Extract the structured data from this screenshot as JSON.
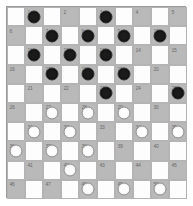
{
  "board": {
    "title": "International Draughts Board",
    "variant": "10x10",
    "rows": 10,
    "columns": 10,
    "colors": {
      "light_square": "#fdfdfd",
      "dark_square": "#b9b9b9",
      "black_piece": "#1b1b1b",
      "white_piece": "#fefefe",
      "grid_line": "#b4b4b4",
      "number_text": "#6a6a6a",
      "background": "#ffffff"
    },
    "legend": {
      "black_label": "black",
      "white_label": "white",
      "empty_label": "empty"
    },
    "squares": [
      [
        {
          "shade": "light",
          "number": "",
          "piece": ""
        },
        {
          "shade": "dark",
          "number": "1",
          "piece": "black"
        },
        {
          "shade": "light",
          "number": "",
          "piece": ""
        },
        {
          "shade": "dark",
          "number": "2",
          "piece": ""
        },
        {
          "shade": "light",
          "number": "",
          "piece": ""
        },
        {
          "shade": "dark",
          "number": "3",
          "piece": "black"
        },
        {
          "shade": "light",
          "number": "",
          "piece": ""
        },
        {
          "shade": "dark",
          "number": "4",
          "piece": ""
        },
        {
          "shade": "light",
          "number": "",
          "piece": ""
        },
        {
          "shade": "dark",
          "number": "5",
          "piece": ""
        }
      ],
      [
        {
          "shade": "dark",
          "number": "6",
          "piece": ""
        },
        {
          "shade": "light",
          "number": "",
          "piece": ""
        },
        {
          "shade": "dark",
          "number": "7",
          "piece": "black"
        },
        {
          "shade": "light",
          "number": "",
          "piece": ""
        },
        {
          "shade": "dark",
          "number": "8",
          "piece": "black"
        },
        {
          "shade": "light",
          "number": "",
          "piece": ""
        },
        {
          "shade": "dark",
          "number": "9",
          "piece": "black"
        },
        {
          "shade": "light",
          "number": "",
          "piece": ""
        },
        {
          "shade": "dark",
          "number": "10",
          "piece": "black"
        },
        {
          "shade": "light",
          "number": "",
          "piece": ""
        }
      ],
      [
        {
          "shade": "light",
          "number": "",
          "piece": ""
        },
        {
          "shade": "dark",
          "number": "11",
          "piece": "black"
        },
        {
          "shade": "light",
          "number": "",
          "piece": ""
        },
        {
          "shade": "dark",
          "number": "12",
          "piece": "black"
        },
        {
          "shade": "light",
          "number": "",
          "piece": ""
        },
        {
          "shade": "dark",
          "number": "13",
          "piece": "black"
        },
        {
          "shade": "light",
          "number": "",
          "piece": ""
        },
        {
          "shade": "dark",
          "number": "14",
          "piece": ""
        },
        {
          "shade": "light",
          "number": "",
          "piece": ""
        },
        {
          "shade": "dark",
          "number": "15",
          "piece": ""
        }
      ],
      [
        {
          "shade": "dark",
          "number": "16",
          "piece": ""
        },
        {
          "shade": "light",
          "number": "",
          "piece": ""
        },
        {
          "shade": "dark",
          "number": "17",
          "piece": "black"
        },
        {
          "shade": "light",
          "number": "",
          "piece": ""
        },
        {
          "shade": "dark",
          "number": "18",
          "piece": "black"
        },
        {
          "shade": "light",
          "number": "",
          "piece": ""
        },
        {
          "shade": "dark",
          "number": "19",
          "piece": "black"
        },
        {
          "shade": "light",
          "number": "",
          "piece": ""
        },
        {
          "shade": "dark",
          "number": "20",
          "piece": ""
        },
        {
          "shade": "light",
          "number": "",
          "piece": ""
        }
      ],
      [
        {
          "shade": "light",
          "number": "",
          "piece": ""
        },
        {
          "shade": "dark",
          "number": "21",
          "piece": ""
        },
        {
          "shade": "light",
          "number": "",
          "piece": ""
        },
        {
          "shade": "dark",
          "number": "22",
          "piece": ""
        },
        {
          "shade": "light",
          "number": "",
          "piece": ""
        },
        {
          "shade": "dark",
          "number": "23",
          "piece": "black"
        },
        {
          "shade": "light",
          "number": "",
          "piece": ""
        },
        {
          "shade": "dark",
          "number": "24",
          "piece": ""
        },
        {
          "shade": "light",
          "number": "",
          "piece": ""
        },
        {
          "shade": "dark",
          "number": "25",
          "piece": "black"
        }
      ],
      [
        {
          "shade": "dark",
          "number": "26",
          "piece": ""
        },
        {
          "shade": "light",
          "number": "",
          "piece": ""
        },
        {
          "shade": "dark",
          "number": "27",
          "piece": "white"
        },
        {
          "shade": "light",
          "number": "",
          "piece": ""
        },
        {
          "shade": "dark",
          "number": "28",
          "piece": "white"
        },
        {
          "shade": "light",
          "number": "",
          "piece": ""
        },
        {
          "shade": "dark",
          "number": "29",
          "piece": "white"
        },
        {
          "shade": "light",
          "number": "",
          "piece": ""
        },
        {
          "shade": "dark",
          "number": "30",
          "piece": ""
        },
        {
          "shade": "light",
          "number": "",
          "piece": ""
        }
      ],
      [
        {
          "shade": "light",
          "number": "",
          "piece": ""
        },
        {
          "shade": "dark",
          "number": "31",
          "piece": "white"
        },
        {
          "shade": "light",
          "number": "",
          "piece": ""
        },
        {
          "shade": "dark",
          "number": "32",
          "piece": "white"
        },
        {
          "shade": "light",
          "number": "",
          "piece": ""
        },
        {
          "shade": "dark",
          "number": "33",
          "piece": ""
        },
        {
          "shade": "light",
          "number": "",
          "piece": ""
        },
        {
          "shade": "dark",
          "number": "34",
          "piece": "white"
        },
        {
          "shade": "light",
          "number": "",
          "piece": ""
        },
        {
          "shade": "dark",
          "number": "35",
          "piece": "white"
        }
      ],
      [
        {
          "shade": "dark",
          "number": "36",
          "piece": "white"
        },
        {
          "shade": "light",
          "number": "",
          "piece": ""
        },
        {
          "shade": "dark",
          "number": "37",
          "piece": "white"
        },
        {
          "shade": "light",
          "number": "",
          "piece": ""
        },
        {
          "shade": "dark",
          "number": "38",
          "piece": "white"
        },
        {
          "shade": "light",
          "number": "",
          "piece": ""
        },
        {
          "shade": "dark",
          "number": "39",
          "piece": ""
        },
        {
          "shade": "light",
          "number": "",
          "piece": ""
        },
        {
          "shade": "dark",
          "number": "40",
          "piece": ""
        },
        {
          "shade": "light",
          "number": "",
          "piece": ""
        }
      ],
      [
        {
          "shade": "light",
          "number": "",
          "piece": ""
        },
        {
          "shade": "dark",
          "number": "41",
          "piece": ""
        },
        {
          "shade": "light",
          "number": "",
          "piece": ""
        },
        {
          "shade": "dark",
          "number": "42",
          "piece": "white"
        },
        {
          "shade": "light",
          "number": "",
          "piece": ""
        },
        {
          "shade": "dark",
          "number": "43",
          "piece": ""
        },
        {
          "shade": "light",
          "number": "",
          "piece": ""
        },
        {
          "shade": "dark",
          "number": "44",
          "piece": ""
        },
        {
          "shade": "light",
          "number": "",
          "piece": ""
        },
        {
          "shade": "dark",
          "number": "45",
          "piece": ""
        }
      ],
      [
        {
          "shade": "dark",
          "number": "46",
          "piece": ""
        },
        {
          "shade": "light",
          "number": "",
          "piece": ""
        },
        {
          "shade": "dark",
          "number": "47",
          "piece": ""
        },
        {
          "shade": "light",
          "number": "",
          "piece": ""
        },
        {
          "shade": "dark",
          "number": "48",
          "piece": "white"
        },
        {
          "shade": "light",
          "number": "",
          "piece": ""
        },
        {
          "shade": "dark",
          "number": "49",
          "piece": "white"
        },
        {
          "shade": "light",
          "number": "",
          "piece": ""
        },
        {
          "shade": "dark",
          "number": "50",
          "piece": "white"
        },
        {
          "shade": "light",
          "number": "",
          "piece": ""
        }
      ]
    ]
  }
}
